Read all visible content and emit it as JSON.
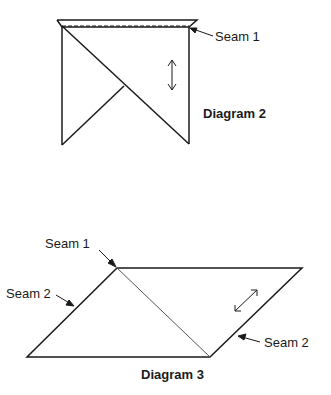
{
  "diagram2": {
    "title": "Diagram 2",
    "labels": {
      "seam1": "Seam 1"
    }
  },
  "diagram3": {
    "title": "Diagram 3",
    "labels": {
      "seam1": "Seam 1",
      "seam2_left": "Seam 2",
      "seam2_right": "Seam 2"
    }
  },
  "colors": {
    "line": "#1a1a1a",
    "background": "#ffffff"
  }
}
